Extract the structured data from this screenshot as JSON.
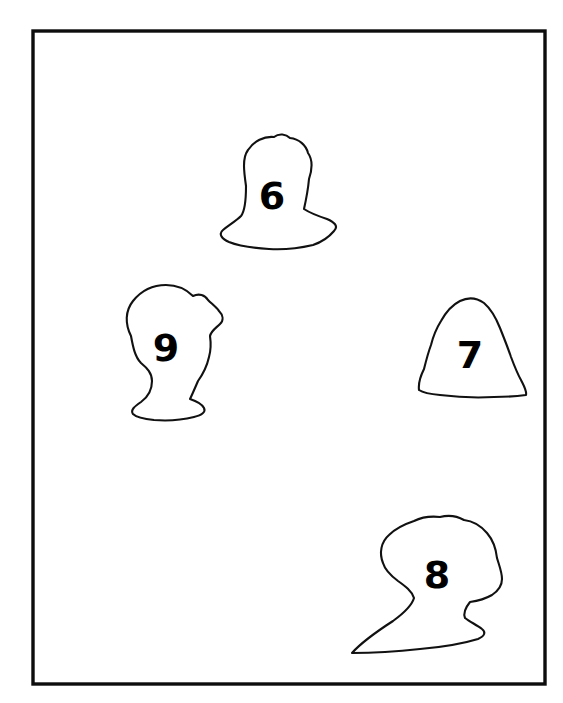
{
  "figure": {
    "background_color": "#ffffff",
    "ink_color": "#111111",
    "label_color": "#000000",
    "frame": {
      "name": "outer-border",
      "x": 33,
      "y": 31,
      "width": 512,
      "height": 653,
      "stroke_width": 3.4,
      "stroke_color": "#0d0d0d"
    },
    "shapes": [
      {
        "id": "shape-6",
        "label": "6",
        "label_x": 272,
        "label_y": 196,
        "label_size": 38,
        "description": "head-and-shoulders silhouette, upper middle",
        "path": "M246,186 C244,172 242,158 248,150 C254,141 264,136 274,137 C279,133 286,134 290,138 C299,139 306,145 308,153 C313,160 312,170 309,179 C308,190 306,200 304,209 C310,213 318,216 327,219 C334,222 339,226 334,231 C329,237 322,242 313,245 C300,248 284,250 269,249 C253,248 239,246 229,242 C222,239 218,234 223,230 C229,225 236,221 241,216 C245,211 246,199 246,186 Z"
      },
      {
        "id": "shape-9",
        "label": "9",
        "label_x": 166,
        "label_y": 348,
        "label_size": 38,
        "description": "head silhouette facing left, middle left",
        "path": "M131,336 C125,324 125,311 133,301 C141,291 153,285 166,285 C177,285 186,289 193,296 C199,293 205,295 208,300 C212,304 216,307 219,311 C223,315 224,320 220,324 C216,328 211,331 210,336 C211,343 211,350 209,357 C207,366 203,374 198,381 C195,388 192,395 190,399 C196,401 202,404 204,408 C206,412 202,415 194,417 C182,420 167,421 154,420 C144,419 136,417 133,414 C130,410 135,406 141,402 C148,397 152,390 152,381 C152,373 147,368 141,363 C135,357 133,347 131,336 Z"
      },
      {
        "id": "shape-7",
        "label": "7",
        "label_x": 470,
        "label_y": 355,
        "label_size": 38,
        "description": "rounded dome / bust silhouette, middle right",
        "path": "M419,390 C418,382 421,375 424,369 C426,361 428,353 431,345 C433,337 436,329 441,321 C446,312 452,305 460,301 C468,297 477,298 484,303 C491,309 496,318 500,328 C504,338 508,348 511,357 C514,365 517,373 521,380 C524,386 527,391 526,395 C519,396 508,397 494,397 C476,398 456,397 440,395 C429,394 422,392 419,390 Z"
      },
      {
        "id": "shape-8",
        "label": "8",
        "label_x": 437,
        "label_y": 575,
        "label_size": 38,
        "description": "head-and-shoulder silhouette facing left with long sweeping tail, lower right",
        "path": "M383,563 C379,553 381,542 389,535 C396,528 405,524 414,521 C422,517 431,516 440,517 C448,515 457,516 464,520 C473,521 481,526 487,533 C493,540 496,549 497,558 C499,565 502,572 502,579 C502,586 498,591 492,595 C485,599 477,601 470,602 C466,607 463,613 465,618 C470,622 477,625 482,629 C486,632 485,636 478,639 C465,643 444,647 420,649 C393,652 367,653 352,653 C360,644 376,632 393,621 C404,613 412,605 414,598 C412,591 405,586 398,581 C390,575 385,570 383,563 Z"
      }
    ]
  }
}
